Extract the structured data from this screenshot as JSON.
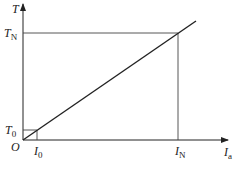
{
  "diagram": {
    "type": "linear characteristic plot",
    "y_axis": {
      "label": "T"
    },
    "x_axis": {
      "label": "I",
      "label_sub": "a"
    },
    "origin": "O",
    "points": {
      "T0": {
        "label": "T",
        "sub": "0"
      },
      "TN": {
        "label": "T",
        "sub": "N"
      },
      "I0": {
        "label": "I",
        "sub": "0"
      },
      "IN": {
        "label": "I",
        "sub": "N"
      }
    },
    "line_color": "#222222",
    "guide_color": "#444444"
  }
}
